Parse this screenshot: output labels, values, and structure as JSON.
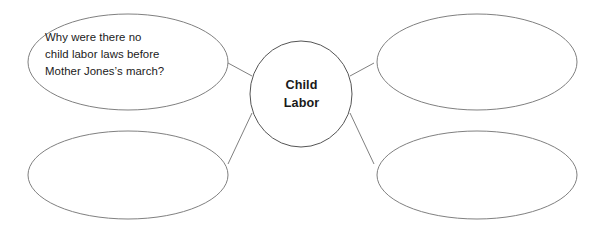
{
  "diagram": {
    "type": "concept-web",
    "background_color": "#ffffff",
    "stroke_color": "#808080",
    "text_color": "#1a1a1a",
    "center": {
      "label": "Child\nLabor",
      "line1": "Child",
      "line2": "Labor",
      "shape": "ellipse",
      "bold": true
    },
    "branches": [
      {
        "position": "top-left",
        "shape": "ellipse",
        "text": "Why were there no\nchild labor laws before\nMother Jones’s march?",
        "filled": true
      },
      {
        "position": "top-right",
        "shape": "ellipse",
        "text": "",
        "filled": false
      },
      {
        "position": "bottom-left",
        "shape": "ellipse",
        "text": "",
        "filled": false
      },
      {
        "position": "bottom-right",
        "shape": "ellipse",
        "text": "",
        "filled": false
      }
    ]
  }
}
